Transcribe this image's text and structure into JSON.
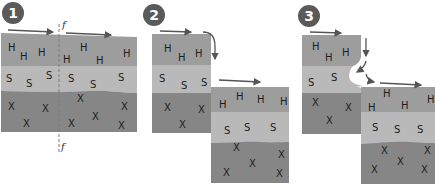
{
  "colors": {
    "hard_rock": "#9d9d9d",
    "soft_rock": "#b9b9b9",
    "base_rock": "#868686",
    "badge": "#5a5a5a",
    "arrow": "#555555",
    "fault_line": "#7a7a7a",
    "background": "#ffffff"
  },
  "panels": [
    {
      "step": "1",
      "description": "River flows over resistant rock (H) lying on softer rock (S); fault line f-f crosses the layers",
      "fault_label_top": "f",
      "fault_label_bottom": "f",
      "layer_labels": {
        "hard": "H",
        "soft": "S",
        "base": "X"
      }
    },
    {
      "step": "2",
      "description": "Displacement along the fault creates a step; water plunges over the edge",
      "layer_labels": {
        "hard": "H",
        "soft": "S",
        "base": "X"
      }
    },
    {
      "step": "3",
      "description": "Soft rock beneath the hard cap is eroded, undercutting the waterfall",
      "layer_labels": {
        "hard": "H",
        "soft": "S",
        "base": "X"
      }
    }
  ],
  "legend_letters": [
    "H",
    "S",
    "X"
  ]
}
